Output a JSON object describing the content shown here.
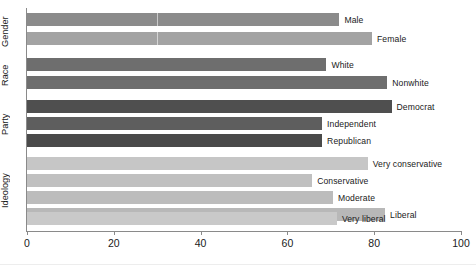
{
  "chart_data": {
    "type": "bar",
    "orientation": "horizontal",
    "title": "",
    "subtitle": "",
    "xlabel": "",
    "ylabel": "",
    "xlim": [
      0,
      100
    ],
    "ylim": null,
    "grid": false,
    "legend": null,
    "axis": {
      "x_ticks": [
        {
          "value": 0,
          "label": "0"
        },
        {
          "value": 20,
          "label": "20"
        },
        {
          "value": 40,
          "label": "40"
        },
        {
          "value": 60,
          "label": "60"
        },
        {
          "value": 80,
          "label": "80"
        },
        {
          "value": 100,
          "label": "100"
        }
      ]
    },
    "groups": [
      {
        "name": "Gender",
        "bars": [
          {
            "label": "Male",
            "value": 72.0,
            "color": "#8b8b8b"
          },
          {
            "label": "Female",
            "value": 79.5,
            "color": "#a3a3a3"
          }
        ]
      },
      {
        "name": "Race",
        "bars": [
          {
            "label": "White",
            "value": 69.0,
            "color": "#6e6e6e"
          },
          {
            "label": "Nonwhite",
            "value": 83.0,
            "color": "#6e6e6e"
          }
        ]
      },
      {
        "name": "Party",
        "bars": [
          {
            "label": "Democrat",
            "value": 84.0,
            "color": "#4f4f4f"
          },
          {
            "label": "Independent",
            "value": 68.0,
            "color": "#5e5e5e"
          },
          {
            "label": "Republican",
            "value": 68.0,
            "color": "#4a4a4a"
          }
        ]
      },
      {
        "name": "Ideology",
        "bars": [
          {
            "label": "Very conservative",
            "value": 78.5,
            "color": "#c6c6c6"
          },
          {
            "label": "Conservative",
            "value": 65.7,
            "color": "#c0c0c0"
          },
          {
            "label": "Moderate",
            "value": 70.5,
            "color": "#bcbcbc"
          },
          {
            "label": "Liberal",
            "value": 82.5,
            "color": "#b8b8b8"
          },
          {
            "label": "Very liberal",
            "value": 71.4,
            "color": "#c9c9c9"
          }
        ]
      }
    ],
    "categories": [
      "Male",
      "Female",
      "White",
      "Nonwhite",
      "Democrat",
      "Independent",
      "Republican",
      "Very conservative",
      "Conservative",
      "Moderate",
      "Liberal",
      "Very liberal"
    ],
    "values": [
      72.0,
      79.5,
      69.0,
      83.0,
      84.0,
      68.0,
      68.0,
      78.5,
      65.7,
      70.5,
      82.5,
      71.4
    ]
  }
}
